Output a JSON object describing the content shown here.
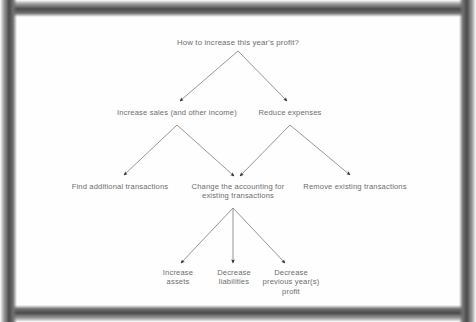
{
  "diagram": {
    "type": "tree",
    "title": "How to increase this year's profit?",
    "text_color": "#6d6d6d",
    "line_color": "#8a8a8a",
    "arrowhead_color": "#2f2f2f",
    "page_color": "#fefefe",
    "frame_color": "#4a4a4a",
    "nodes": {
      "root": "How to increase this year's profit?",
      "level2_left": "Increase sales (and other income)",
      "level2_right": "Reduce expenses",
      "level3_left": "Find additional transactions",
      "level3_center": "Change the accounting for\nexisting transactions",
      "level3_right": "Remove existing transactions",
      "level4_left": "Increase\nassets",
      "level4_center": "Decrease\nliabilities",
      "level4_right": "Decrease\nprevious year(s)\nprofit"
    },
    "edges": [
      {
        "from": "root",
        "to": "level2_left"
      },
      {
        "from": "root",
        "to": "level2_right"
      },
      {
        "from": "level2_left",
        "to": "level3_left"
      },
      {
        "from": "level2_left",
        "to": "level3_center"
      },
      {
        "from": "level2_right",
        "to": "level3_center"
      },
      {
        "from": "level2_right",
        "to": "level3_right"
      },
      {
        "from": "level3_center",
        "to": "level4_left"
      },
      {
        "from": "level3_center",
        "to": "level4_center"
      },
      {
        "from": "level3_center",
        "to": "level4_right"
      }
    ]
  }
}
